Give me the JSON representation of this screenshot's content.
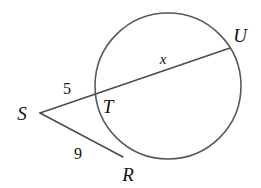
{
  "figure": {
    "kind": "circle-secant-tangent-geometry-diagram",
    "background_color": "#ffffff",
    "stroke_color": "#59595b",
    "text_color": "#111111",
    "circle": {
      "center_x": 168,
      "center_y": 86,
      "radius": 73
    },
    "points": {
      "S": {
        "label": "S",
        "x": 40,
        "y": 113,
        "label_x": 22,
        "label_y": 120
      },
      "T": {
        "label": "T",
        "x": 95,
        "y": 96,
        "label_x": 103,
        "label_y": 112
      },
      "U": {
        "label": "U",
        "x": 230,
        "y": 48,
        "label_x": 233,
        "label_y": 42
      },
      "R": {
        "label": "R",
        "x": 123,
        "y": 157,
        "label_x": 121,
        "label_y": 181
      }
    },
    "segments": [
      {
        "name": "secant-S-to-U",
        "from": "S",
        "to": "U"
      },
      {
        "name": "segment-S-to-R",
        "from": "S",
        "to": "R"
      }
    ],
    "measure_labels": [
      {
        "name": "length-ST",
        "text": "5",
        "x": 62,
        "y": 94
      },
      {
        "name": "length-TU",
        "text": "x",
        "x": 159,
        "y": 64
      },
      {
        "name": "length-SR",
        "text": "9",
        "x": 73,
        "y": 159
      }
    ]
  }
}
